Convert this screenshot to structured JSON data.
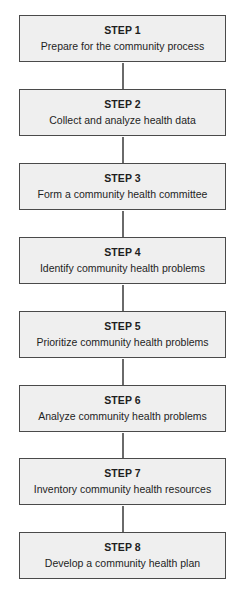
{
  "diagram": {
    "type": "vertical-flowchart",
    "colors": {
      "box_fill": "#efefef",
      "box_border": "#4a4a4a",
      "connector": "#6a6a6a",
      "text": "#1e1e1e"
    },
    "steps": [
      {
        "label": "STEP 1",
        "description": "Prepare for the community process"
      },
      {
        "label": "STEP 2",
        "description": "Collect and analyze health data"
      },
      {
        "label": "STEP 3",
        "description": "Form a community health committee"
      },
      {
        "label": "STEP 4",
        "description": "Identify community health problems"
      },
      {
        "label": "STEP 5",
        "description": "Prioritize community health problems"
      },
      {
        "label": "STEP 6",
        "description": "Analyze community health problems"
      },
      {
        "label": "STEP 7",
        "description": "Inventory community health resources"
      },
      {
        "label": "STEP 8",
        "description": "Develop a community health plan"
      }
    ],
    "edges": [
      {
        "from": "STEP 1",
        "to": "STEP 2"
      },
      {
        "from": "STEP 2",
        "to": "STEP 3"
      },
      {
        "from": "STEP 3",
        "to": "STEP 4"
      },
      {
        "from": "STEP 4",
        "to": "STEP 5"
      },
      {
        "from": "STEP 5",
        "to": "STEP 6"
      },
      {
        "from": "STEP 6",
        "to": "STEP 7"
      },
      {
        "from": "STEP 7",
        "to": "STEP 8"
      }
    ]
  }
}
